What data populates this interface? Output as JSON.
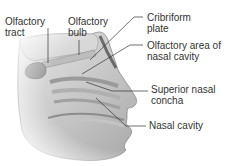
{
  "labels": {
    "olfactory_tract": "Olfactory\ntract",
    "olfactory_bulb": "Olfactory\nbulb",
    "cribriform_plate": "Cribriform\nplate",
    "olfactory_area": "Olfactory area of\nnasal cavity",
    "superior_concha": "Superior nasal\nconcha",
    "nasal_cavity": "Nasal cavity"
  }
}
